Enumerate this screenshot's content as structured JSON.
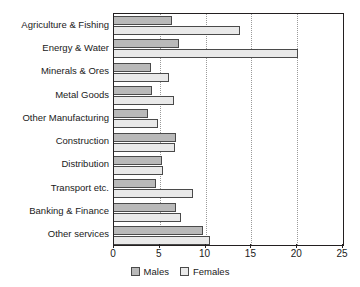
{
  "chart_data": {
    "type": "bar",
    "orientation": "horizontal",
    "title": "",
    "xlabel": "",
    "ylabel": "",
    "xlim": [
      0,
      25
    ],
    "xticks": [
      0,
      5,
      10,
      15,
      20,
      25
    ],
    "xtick_labels": [
      "0",
      "5",
      "10",
      "15",
      "20",
      "25"
    ],
    "grid": "vertical-dotted",
    "legend_position": "bottom-center",
    "categories": [
      "Agriculture & Fishing",
      "Energy & Water",
      "Minerals & Ores",
      "Metal Goods",
      "Other Manufacturing",
      "Construction",
      "Distribution",
      "Transport etc.",
      "Banking & Finance",
      "Other services"
    ],
    "series": [
      {
        "name": "Males",
        "color": "#b9b9b9",
        "values": [
          6.3,
          7.1,
          4.0,
          4.2,
          3.7,
          6.8,
          5.2,
          4.6,
          6.8,
          9.7
        ]
      },
      {
        "name": "Females",
        "color": "#e9e9e9",
        "values": [
          13.8,
          20.1,
          6.0,
          6.5,
          4.8,
          6.7,
          5.4,
          8.6,
          7.3,
          10.5
        ]
      }
    ]
  },
  "legend": {
    "items": [
      {
        "label": "Males",
        "swatch": "males-swatch"
      },
      {
        "label": "Females",
        "swatch": "females-swatch"
      }
    ]
  },
  "colors": {
    "males": "#b9b9b9",
    "females": "#e9e9e9",
    "axis": "#231f20",
    "gridline": "#9a9a9a",
    "background": "#ffffff"
  }
}
